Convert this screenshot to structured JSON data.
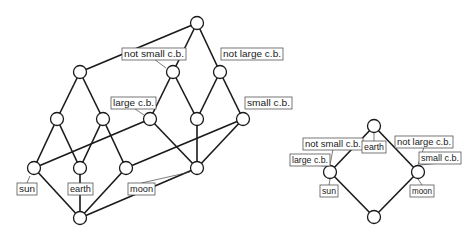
{
  "diagrams": [
    {
      "name": "left-concept-lattice",
      "nodes": [
        {
          "id": "top",
          "x": 197,
          "y": 23
        },
        {
          "id": "a1",
          "x": 80,
          "y": 72
        },
        {
          "id": "a2",
          "x": 173,
          "y": 72
        },
        {
          "id": "a3",
          "x": 220,
          "y": 72
        },
        {
          "id": "b1",
          "x": 57,
          "y": 119
        },
        {
          "id": "b2",
          "x": 103,
          "y": 119
        },
        {
          "id": "b3",
          "x": 150,
          "y": 119
        },
        {
          "id": "b4",
          "x": 197,
          "y": 119
        },
        {
          "id": "b5",
          "x": 243,
          "y": 119
        },
        {
          "id": "c1",
          "x": 34,
          "y": 168
        },
        {
          "id": "c2",
          "x": 80,
          "y": 168
        },
        {
          "id": "c3",
          "x": 126,
          "y": 168
        },
        {
          "id": "c4",
          "x": 197,
          "y": 168
        },
        {
          "id": "bottom",
          "x": 80,
          "y": 218
        }
      ],
      "edges": [
        [
          "top",
          "a1"
        ],
        [
          "top",
          "a2"
        ],
        [
          "top",
          "a3"
        ],
        [
          "a1",
          "b1"
        ],
        [
          "a1",
          "b2"
        ],
        [
          "a2",
          "b3"
        ],
        [
          "a2",
          "b4"
        ],
        [
          "a3",
          "b4"
        ],
        [
          "a3",
          "b5"
        ],
        [
          "b1",
          "c1"
        ],
        [
          "b1",
          "c2"
        ],
        [
          "b2",
          "c2"
        ],
        [
          "b2",
          "c3"
        ],
        [
          "b3",
          "c1"
        ],
        [
          "b3",
          "c4"
        ],
        [
          "b4",
          "c4"
        ],
        [
          "b5",
          "c3"
        ],
        [
          "b5",
          "c4"
        ],
        [
          "c1",
          "bottom"
        ],
        [
          "c2",
          "bottom"
        ],
        [
          "c3",
          "bottom"
        ],
        [
          "c4",
          "bottom"
        ]
      ],
      "labels": [
        {
          "text": "not small c.b.",
          "x": 122,
          "y": 48,
          "w": 64,
          "node": "a2",
          "lx": 166,
          "ly": 68
        },
        {
          "text": "not large c.b.",
          "x": 221,
          "y": 48,
          "w": 62,
          "node": null
        },
        {
          "text": "large c.b.",
          "x": 111,
          "y": 97,
          "w": 45,
          "node": "b3",
          "lx": 144,
          "ly": 115
        },
        {
          "text": "small c.b.",
          "x": 245,
          "y": 97,
          "w": 47,
          "node": null
        },
        {
          "text": "sun",
          "x": 17,
          "y": 183,
          "w": 20,
          "node": "c1",
          "lx": 30,
          "ly": 176
        },
        {
          "text": "earth",
          "x": 68,
          "y": 183,
          "w": 25,
          "node": "c2",
          "lx": 80,
          "ly": 176
        },
        {
          "text": "moon",
          "x": 128,
          "y": 183,
          "w": 27,
          "node": "c4",
          "lx": 190,
          "ly": 172
        }
      ]
    },
    {
      "name": "right-concept-lattice",
      "nodes": [
        {
          "id": "top",
          "x": 374,
          "y": 126
        },
        {
          "id": "left",
          "x": 330,
          "y": 172
        },
        {
          "id": "right",
          "x": 418,
          "y": 172
        },
        {
          "id": "bottom",
          "x": 374,
          "y": 217
        }
      ],
      "edges": [
        [
          "top",
          "left"
        ],
        [
          "top",
          "right"
        ],
        [
          "left",
          "bottom"
        ],
        [
          "right",
          "bottom"
        ]
      ],
      "labels": [
        {
          "text": "not small c.b.",
          "x": 303,
          "y": 138,
          "w": 60,
          "node": "left",
          "lx": 330,
          "ly": 165
        },
        {
          "text": "large c.b.",
          "x": 290,
          "y": 154,
          "w": 40,
          "node": "left",
          "lx": 326,
          "ly": 166
        },
        {
          "text": "earth",
          "x": 362,
          "y": 141,
          "w": 24,
          "node": "top",
          "lx": 374,
          "ly": 133
        },
        {
          "text": "sun",
          "x": 320,
          "y": 185,
          "w": 18,
          "node": "left",
          "lx": 330,
          "ly": 179
        },
        {
          "text": "not large c.b.",
          "x": 395,
          "y": 136,
          "w": 58,
          "node": "right",
          "lx": 418,
          "ly": 165
        },
        {
          "text": "small c.b.",
          "x": 419,
          "y": 152,
          "w": 42,
          "node": "right",
          "lx": 420,
          "ly": 165
        },
        {
          "text": "moon",
          "x": 410,
          "y": 185,
          "w": 24,
          "node": "right",
          "lx": 418,
          "ly": 179
        }
      ]
    }
  ]
}
